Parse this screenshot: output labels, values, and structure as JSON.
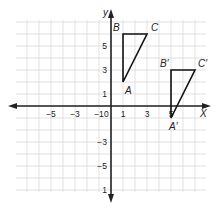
{
  "diagram": {
    "type": "coordinate-plane",
    "axes": {
      "x_label": "X",
      "y_label": "y",
      "x_ticks": [
        {
          "value": -5,
          "label": "−5"
        },
        {
          "value": -3,
          "label": "−3"
        },
        {
          "value": -1,
          "label": "−1"
        },
        {
          "value": 0,
          "label": "0"
        },
        {
          "value": 1,
          "label": "1"
        },
        {
          "value": 3,
          "label": "3"
        },
        {
          "value": 5,
          "label": "5"
        }
      ],
      "y_ticks": [
        {
          "value": 5,
          "label": "5"
        },
        {
          "value": 3,
          "label": "3"
        },
        {
          "value": 1,
          "label": "1"
        },
        {
          "value": -3,
          "label": "−3"
        },
        {
          "value": -5,
          "label": "−5"
        },
        {
          "value": -7,
          "label": "1"
        }
      ],
      "x_range": [
        -8,
        8
      ],
      "y_range": [
        -7,
        7
      ],
      "grid": true
    },
    "triangles": [
      {
        "name": "ABC",
        "vertices": [
          {
            "label": "A",
            "x": 1,
            "y": 2
          },
          {
            "label": "B",
            "x": 1,
            "y": 6
          },
          {
            "label": "C",
            "x": 3,
            "y": 6
          }
        ]
      },
      {
        "name": "A'B'C'",
        "vertices": [
          {
            "label": "A′",
            "x": 5,
            "y": -1
          },
          {
            "label": "B′",
            "x": 5,
            "y": 3
          },
          {
            "label": "C′",
            "x": 7,
            "y": 3
          }
        ]
      }
    ],
    "colors": {
      "grid": "#d9d9d9",
      "axis": "#222222",
      "triangle": "#111111",
      "text": "#222222"
    }
  }
}
